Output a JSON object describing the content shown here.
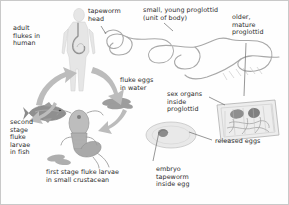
{
  "diagram": {
    "background_color": "#fefefe",
    "border_color": "#c9c9c9",
    "art_color": "#9a9a9a",
    "arrow_color": "#b0b0b0",
    "text_color": "#2b2b2b",
    "labels": [
      {
        "id": "adult-flukes-in-human",
        "text": "adult\nflukes in\nhuman"
      },
      {
        "id": "tapeworm-head",
        "text": "tapeworm\nhead"
      },
      {
        "id": "small-young-proglottid",
        "text": "small, young proglottid\n(unit of body)"
      },
      {
        "id": "older-mature-proglottid",
        "text": "older,\nmature\nproglottid"
      },
      {
        "id": "fluke-eggs-in-water",
        "text": "fluke eggs\nin water"
      },
      {
        "id": "sex-organs-inside-proglottid",
        "text": "sex organs\ninside\nproglottid"
      },
      {
        "id": "released-eggs",
        "text": "released eggs"
      },
      {
        "id": "embryo-tapeworm-inside-egg",
        "text": "embryo\ntapeworm\ninside egg"
      },
      {
        "id": "second-stage-fluke-larvae-in-fish",
        "text": "second\nstage\nfluke\nlarvae\nin fish"
      },
      {
        "id": "first-stage-fluke-larvae",
        "text": "first stage fluke larvae\nin small crustacean"
      }
    ],
    "illustrations": [
      {
        "id": "human-figure",
        "name": "human-body-illustration"
      },
      {
        "id": "tapeworm-strobila",
        "name": "tapeworm-body-chain-illustration"
      },
      {
        "id": "proglottid-cross-section",
        "name": "mature-proglottid-illustration"
      },
      {
        "id": "released-egg-specks",
        "name": "released-eggs-illustration"
      },
      {
        "id": "egg-with-embryo",
        "name": "embryo-egg-illustration"
      },
      {
        "id": "fish",
        "name": "fish-illustration"
      },
      {
        "id": "copepod",
        "name": "crustacean-copepod-illustration"
      },
      {
        "id": "egg-cluster-water",
        "name": "fluke-eggs-in-water-illustration"
      }
    ],
    "arrows": [
      {
        "id": "arrow-human-to-eggs",
        "from": "human",
        "to": "fluke eggs in water"
      },
      {
        "id": "arrow-eggs-to-crustacean",
        "from": "fluke eggs in water",
        "to": "crustacean"
      },
      {
        "id": "arrow-crustacean-to-fish",
        "from": "crustacean",
        "to": "fish"
      },
      {
        "id": "arrow-fish-to-human",
        "from": "fish",
        "to": "human"
      }
    ]
  }
}
